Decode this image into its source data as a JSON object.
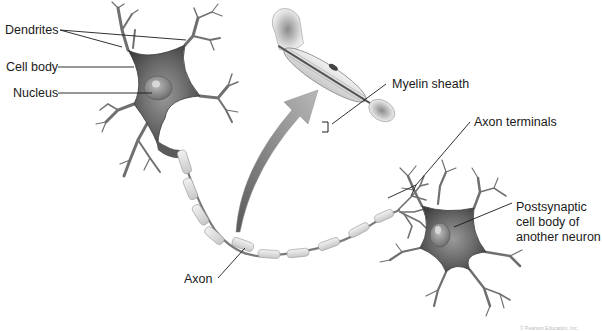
{
  "diagram": {
    "labels": {
      "dendrites": "Dendrites",
      "cell_body": "Cell body",
      "nucleus": "Nucleus",
      "myelin_sheath": "Myelin sheath",
      "axon_terminals": "Axon terminals",
      "postsynaptic_line1": "Postsynaptic",
      "postsynaptic_line2": "cell body of",
      "postsynaptic_line3": "another neuron",
      "axon": "Axon"
    },
    "credit": "© Pearson Education, Inc.",
    "colors": {
      "background": "#ffffff",
      "neuron_fill": "#6e6e6e",
      "neuron_dark": "#3c3c3c",
      "myelin": "#e4e4e4",
      "arrow": "#a8a8a8",
      "leader_line": "#1a1a1a",
      "text": "#1a1a1a"
    }
  }
}
